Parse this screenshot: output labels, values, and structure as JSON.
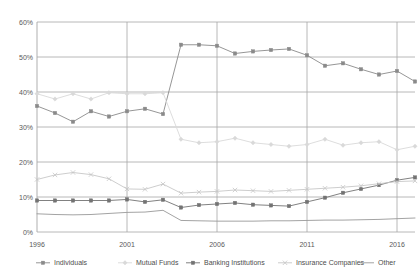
{
  "chart_data": {
    "type": "line",
    "title": "",
    "subtitle": "",
    "xlabel": "",
    "ylabel": "",
    "x": [
      1996,
      1997,
      1998,
      1999,
      2000,
      2001,
      2002,
      2003,
      2004,
      2005,
      2006,
      2007,
      2008,
      2009,
      2010,
      2011,
      2012,
      2013,
      2014,
      2015,
      2016,
      2017
    ],
    "xtick_labels": [
      "1996",
      "2001",
      "2006",
      "2011",
      "2016"
    ],
    "xtick_values": [
      1996,
      2001,
      2006,
      2011,
      2016
    ],
    "xlim": [
      1996,
      2017
    ],
    "ytick_labels": [
      "0%",
      "10%",
      "20%",
      "30%",
      "40%",
      "50%",
      "60%"
    ],
    "ytick_values": [
      0,
      10,
      20,
      30,
      40,
      50,
      60
    ],
    "ylim": [
      0,
      60
    ],
    "grid": true,
    "legend_position": "bottom",
    "series": [
      {
        "name": "Individuals",
        "color": "#8a8a8a",
        "marker": "square",
        "values": [
          36.0,
          34.0,
          31.5,
          34.5,
          33.0,
          34.5,
          35.2,
          33.7,
          53.5,
          53.5,
          53.2,
          51.0,
          51.6,
          52.0,
          52.3,
          50.5,
          47.5,
          48.2,
          46.5,
          45.0,
          46.0,
          43.0
        ]
      },
      {
        "name": "Mutual Funds",
        "color": "#d9d9d9",
        "marker": "diamond",
        "values": [
          39.5,
          38.0,
          39.5,
          38.0,
          39.8,
          39.5,
          39.5,
          39.8,
          26.5,
          25.5,
          25.8,
          26.8,
          25.5,
          25.0,
          24.5,
          25.0,
          26.5,
          24.8,
          25.5,
          25.8,
          23.5,
          24.5
        ]
      },
      {
        "name": "Banking Institutions",
        "color": "#737373",
        "marker": "square",
        "values": [
          9.0,
          9.0,
          9.0,
          9.0,
          9.0,
          9.3,
          8.6,
          9.2,
          7.0,
          7.7,
          8.0,
          8.3,
          7.8,
          7.6,
          7.4,
          8.6,
          9.8,
          11.2,
          12.3,
          13.4,
          14.8,
          15.6
        ]
      },
      {
        "name": "Insurance Companies",
        "color": "#c7c7c7",
        "marker": "cross",
        "values": [
          15.0,
          16.3,
          17.0,
          16.4,
          15.2,
          12.3,
          12.2,
          13.7,
          11.1,
          11.4,
          11.6,
          12.0,
          11.8,
          11.6,
          11.9,
          12.2,
          12.5,
          12.8,
          13.2,
          13.8,
          14.4,
          14.6
        ]
      },
      {
        "name": "Other",
        "color": "#999999",
        "marker": "none",
        "values": [
          5.2,
          5.0,
          4.9,
          5.0,
          5.3,
          5.6,
          5.7,
          6.2,
          3.3,
          3.2,
          3.1,
          3.1,
          3.1,
          3.2,
          3.2,
          3.3,
          3.4,
          3.4,
          3.5,
          3.6,
          3.8,
          4.0
        ]
      }
    ]
  },
  "legend": {
    "items": [
      {
        "label": "Individuals",
        "marker": "square-line",
        "color": "#8a8a8a"
      },
      {
        "label": "Mutual Funds",
        "marker": "diamond-line",
        "color": "#d9d9d9"
      },
      {
        "label": "Banking Institutions",
        "marker": "square-line",
        "color": "#737373"
      },
      {
        "label": "Insurance Companies",
        "marker": "cross-line",
        "color": "#c7c7c7"
      },
      {
        "label": "Other",
        "marker": "plain-line",
        "color": "#999999"
      }
    ]
  },
  "axes": {
    "y_ticks": [
      "60%",
      "50%",
      "40%",
      "30%",
      "20%",
      "10%",
      "0%"
    ],
    "x_ticks": [
      "1996",
      "2001",
      "2006",
      "2011",
      "2016"
    ]
  },
  "colors": {
    "gridline": "#a6a6a6",
    "axis_text": "#595959",
    "background": "#ffffff"
  }
}
